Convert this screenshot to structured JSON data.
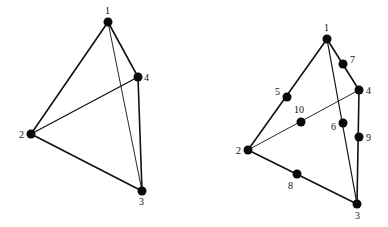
{
  "diagrams": [
    {
      "id": "tetra4",
      "nodes": [
        {
          "label": "1",
          "x": 108,
          "y": 22,
          "lx": 105,
          "ly": 14
        },
        {
          "label": "2",
          "x": 31,
          "y": 134,
          "lx": 19,
          "ly": 138
        },
        {
          "label": "3",
          "x": 142,
          "y": 191,
          "lx": 139,
          "ly": 205
        },
        {
          "label": "4",
          "x": 138,
          "y": 77,
          "lx": 144,
          "ly": 81
        }
      ],
      "edges": [
        {
          "from": 0,
          "to": 1,
          "w": 1.6
        },
        {
          "from": 0,
          "to": 3,
          "w": 1.6
        },
        {
          "from": 0,
          "to": 2,
          "w": 0.9
        },
        {
          "from": 1,
          "to": 3,
          "w": 1.3
        },
        {
          "from": 1,
          "to": 2,
          "w": 1.6
        },
        {
          "from": 3,
          "to": 2,
          "w": 1.6
        }
      ]
    },
    {
      "id": "tetra10",
      "nodes": [
        {
          "label": "1",
          "x": 327,
          "y": 39,
          "lx": 324,
          "ly": 31
        },
        {
          "label": "2",
          "x": 248,
          "y": 150,
          "lx": 236,
          "ly": 154
        },
        {
          "label": "3",
          "x": 357,
          "y": 204,
          "lx": 355,
          "ly": 219
        },
        {
          "label": "4",
          "x": 359,
          "y": 90,
          "lx": 366,
          "ly": 94
        },
        {
          "label": "5",
          "x": 287,
          "y": 97,
          "lx": 275,
          "ly": 95
        },
        {
          "label": "6",
          "x": 343,
          "y": 123,
          "lx": 331,
          "ly": 130
        },
        {
          "label": "7",
          "x": 343,
          "y": 64,
          "lx": 350,
          "ly": 63
        },
        {
          "label": "8",
          "x": 297,
          "y": 174,
          "lx": 288,
          "ly": 189
        },
        {
          "label": "9",
          "x": 359,
          "y": 137,
          "lx": 366,
          "ly": 141
        },
        {
          "label": "10",
          "x": 301,
          "y": 122,
          "lx": 294,
          "ly": 113
        }
      ],
      "edges": [
        {
          "from": 0,
          "to": 1,
          "w": 1.6
        },
        {
          "from": 0,
          "to": 3,
          "w": 1.6
        },
        {
          "from": 0,
          "to": 2,
          "w": 1.2
        },
        {
          "from": 1,
          "to": 3,
          "w": 0.9
        },
        {
          "from": 1,
          "to": 2,
          "w": 1.6
        },
        {
          "from": 3,
          "to": 2,
          "w": 1.6
        }
      ]
    }
  ],
  "style": {
    "line_color": "#111111",
    "node_color": "#0a0a0a",
    "node_radius": 4.5,
    "background": "#ffffff"
  }
}
